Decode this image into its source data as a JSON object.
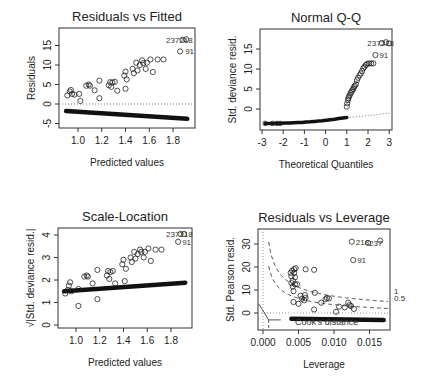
{
  "chart_data": [
    {
      "type": "scatter",
      "title": "Residuals vs Fitted",
      "xlabel": "Predicted values",
      "ylabel": "Residuals",
      "xlim": [
        0.85,
        1.95
      ],
      "ylim": [
        -6,
        18.5
      ],
      "xticks": [
        "1.0",
        "1.2",
        "1.4",
        "1.6",
        "1.8"
      ],
      "yticks": [
        "-5",
        "0",
        "5",
        "10",
        "15"
      ],
      "reference_line": {
        "y": 0,
        "style": "dotted"
      },
      "point_labels": [
        "237",
        "218",
        "91"
      ],
      "upper_points": [
        [
          0.91,
          2.2
        ],
        [
          0.93,
          3.2
        ],
        [
          0.94,
          3.6
        ],
        [
          0.95,
          2.6
        ],
        [
          0.97,
          2.4
        ],
        [
          1.01,
          2.6
        ],
        [
          1.02,
          0.8
        ],
        [
          1.07,
          4.7
        ],
        [
          1.09,
          5.0
        ],
        [
          1.1,
          4.7
        ],
        [
          1.14,
          3.5
        ],
        [
          1.18,
          6.0
        ],
        [
          1.18,
          1.5
        ],
        [
          1.26,
          4.8
        ],
        [
          1.27,
          5.6
        ],
        [
          1.28,
          4.4
        ],
        [
          1.29,
          5.5
        ],
        [
          1.31,
          5.7
        ],
        [
          1.33,
          3.4
        ],
        [
          1.39,
          7.3
        ],
        [
          1.4,
          8.3
        ],
        [
          1.4,
          3.9
        ],
        [
          1.41,
          6.3
        ],
        [
          1.46,
          9.0
        ],
        [
          1.47,
          7.9
        ],
        [
          1.49,
          10.6
        ],
        [
          1.5,
          8.6
        ],
        [
          1.52,
          10.0
        ],
        [
          1.54,
          11.2
        ],
        [
          1.55,
          10.5
        ],
        [
          1.57,
          9.0
        ],
        [
          1.58,
          10.6
        ],
        [
          1.61,
          11.4
        ],
        [
          1.63,
          8.2
        ],
        [
          1.67,
          11.4
        ],
        [
          1.72,
          11.4
        ],
        [
          1.86,
          13.5
        ],
        [
          1.88,
          16.5
        ],
        [
          1.91,
          16.6
        ]
      ],
      "lower_band": {
        "x": [
          0.9,
          1.92
        ],
        "y": [
          -1.8,
          -3.8
        ]
      }
    },
    {
      "type": "scatter",
      "title": "Normal Q-Q",
      "xlabel": "Theoretical Quantiles",
      "ylabel": "Std. deviance resid.",
      "xlim": [
        -3.1,
        3.1
      ],
      "ylim": [
        -4.5,
        19
      ],
      "xticks": [
        "-3",
        "-2",
        "-1",
        "0",
        "1",
        "2",
        "3"
      ],
      "yticks": [
        "0",
        "5",
        "10",
        "15"
      ],
      "reference_line": {
        "from": [
          1,
          -2.2
        ],
        "to": [
          3.1,
          -1.0
        ],
        "style": "dotted"
      },
      "point_labels": [
        "237",
        "218",
        "91"
      ],
      "upper_points": [
        [
          1.0,
          0.6
        ],
        [
          1.02,
          1.4
        ],
        [
          1.05,
          2.2
        ],
        [
          1.08,
          2.7
        ],
        [
          1.1,
          3.1
        ],
        [
          1.14,
          3.5
        ],
        [
          1.18,
          4.0
        ],
        [
          1.22,
          4.3
        ],
        [
          1.26,
          4.7
        ],
        [
          1.3,
          5.0
        ],
        [
          1.34,
          5.5
        ],
        [
          1.38,
          5.8
        ],
        [
          1.43,
          6.2
        ],
        [
          1.48,
          7.2
        ],
        [
          1.53,
          7.8
        ],
        [
          1.6,
          8.4
        ],
        [
          1.66,
          8.9
        ],
        [
          1.72,
          9.5
        ],
        [
          1.78,
          10.2
        ],
        [
          1.84,
          10.6
        ],
        [
          1.9,
          11.0
        ],
        [
          1.96,
          11.3
        ],
        [
          2.05,
          11.4
        ],
        [
          2.15,
          11.4
        ],
        [
          2.25,
          11.4
        ],
        [
          2.35,
          13.5
        ],
        [
          2.65,
          16.5
        ],
        [
          2.85,
          16.7
        ],
        [
          3.0,
          16.4
        ]
      ],
      "lower_curve": {
        "x": [
          -2.85,
          1.0
        ],
        "y_start": -3.6,
        "y_end": -2.1
      }
    },
    {
      "type": "scatter",
      "title": "Scale-Location",
      "xlabel": "Predicted values",
      "ylabel": "√|Std. deviance resid.|",
      "xlim": [
        0.85,
        1.95
      ],
      "ylim": [
        -0.2,
        4.3
      ],
      "xticks": [
        "1.0",
        "1.2",
        "1.4",
        "1.6",
        "1.8"
      ],
      "yticks": [
        "0",
        "1",
        "2",
        "3",
        "4"
      ],
      "point_labels": [
        "237",
        "218",
        "91"
      ],
      "upper_points": [
        [
          0.91,
          1.4
        ],
        [
          0.93,
          1.55
        ],
        [
          0.94,
          1.75
        ],
        [
          0.95,
          1.9
        ],
        [
          0.96,
          1.5
        ],
        [
          1.02,
          0.85
        ],
        [
          1.02,
          1.6
        ],
        [
          1.07,
          2.15
        ],
        [
          1.09,
          2.2
        ],
        [
          1.1,
          2.15
        ],
        [
          1.14,
          1.85
        ],
        [
          1.18,
          2.45
        ],
        [
          1.18,
          1.15
        ],
        [
          1.26,
          2.2
        ],
        [
          1.27,
          2.4
        ],
        [
          1.28,
          2.05
        ],
        [
          1.29,
          2.35
        ],
        [
          1.31,
          2.4
        ],
        [
          1.33,
          1.85
        ],
        [
          1.39,
          2.7
        ],
        [
          1.4,
          2.9
        ],
        [
          1.41,
          1.95
        ],
        [
          1.42,
          2.5
        ],
        [
          1.46,
          3.0
        ],
        [
          1.47,
          2.8
        ],
        [
          1.49,
          3.25
        ],
        [
          1.5,
          2.95
        ],
        [
          1.52,
          3.15
        ],
        [
          1.54,
          3.35
        ],
        [
          1.55,
          3.25
        ],
        [
          1.57,
          3.0
        ],
        [
          1.58,
          3.25
        ],
        [
          1.61,
          3.4
        ],
        [
          1.63,
          2.85
        ],
        [
          1.67,
          3.35
        ],
        [
          1.72,
          3.35
        ],
        [
          1.86,
          3.7
        ],
        [
          1.88,
          4.05
        ],
        [
          1.91,
          4.05
        ]
      ],
      "lower_band": {
        "x": [
          0.9,
          1.92
        ],
        "y": [
          1.5,
          1.88
        ]
      }
    },
    {
      "type": "scatter",
      "title": "Residuals vs Leverage",
      "xlabel": "Leverage",
      "ylabel": "Std. Pearson resid.",
      "xlim": [
        -0.0007,
        0.0178
      ],
      "ylim": [
        -7,
        37
      ],
      "xticks": [
        "0.000",
        "0.005",
        "0.010",
        "0.015"
      ],
      "yticks": [
        "0",
        "10",
        "20",
        "30"
      ],
      "legend": "Cook's distance",
      "contour_labels": [
        "1",
        "0.5"
      ],
      "point_labels": [
        "218",
        "237",
        "91"
      ],
      "upper_points": [
        [
          0.0039,
          17.5
        ],
        [
          0.004,
          16.0
        ],
        [
          0.004,
          13.0
        ],
        [
          0.0041,
          18.5
        ],
        [
          0.0042,
          14.0
        ],
        [
          0.0042,
          11.5
        ],
        [
          0.0043,
          9.5
        ],
        [
          0.0043,
          4.8
        ],
        [
          0.0044,
          19.0
        ],
        [
          0.0044,
          17.5
        ],
        [
          0.0045,
          15.5
        ],
        [
          0.0045,
          12.5
        ],
        [
          0.0046,
          19.5
        ],
        [
          0.0048,
          12.5
        ],
        [
          0.005,
          4.0
        ],
        [
          0.0053,
          7.5
        ],
        [
          0.0055,
          6.2
        ],
        [
          0.0058,
          5.5
        ],
        [
          0.0059,
          7.8
        ],
        [
          0.006,
          6.5
        ],
        [
          0.006,
          19.0
        ],
        [
          0.0072,
          18.8
        ],
        [
          0.0072,
          1.5
        ],
        [
          0.0073,
          8.8
        ],
        [
          0.0082,
          4.5
        ],
        [
          0.0088,
          6.0
        ],
        [
          0.009,
          6.5
        ],
        [
          0.0093,
          6.3
        ],
        [
          0.0103,
          0.5
        ],
        [
          0.0107,
          2.8
        ],
        [
          0.0115,
          2.5
        ],
        [
          0.012,
          4.5
        ],
        [
          0.0122,
          3.5
        ],
        [
          0.0124,
          3.0
        ],
        [
          0.0128,
          1.8
        ],
        [
          0.0127,
          23.0
        ],
        [
          0.0125,
          31.0
        ],
        [
          0.0148,
          30.5
        ],
        [
          0.0165,
          31.5
        ]
      ],
      "lower_band": {
        "x": [
          0.004,
          0.017
        ],
        "y": [
          -2.5,
          -3.0
        ]
      }
    }
  ]
}
